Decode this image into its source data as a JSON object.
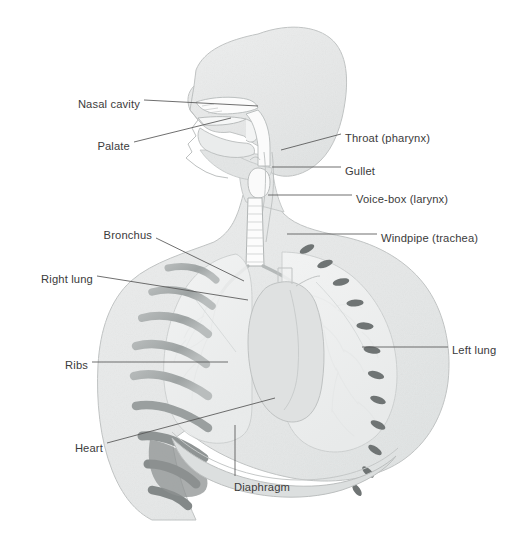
{
  "figure": {
    "background_color": "#ffffff",
    "label_color": "#3b3b3b",
    "leader_color": "#555555",
    "body_fill": "#e9eaea",
    "body_stroke": "#b9bcbc",
    "rib_fill": "#a9adad",
    "rib_dark_fill": "#8d9192",
    "lung_fill": "#f1f2f2",
    "airway_fill": "#fbfbfb",
    "heart_fill": "#dcdedd",
    "width": 515,
    "height": 540
  },
  "labels": [
    {
      "id": "nasal-cavity",
      "text": "Nasal cavity",
      "side": "left",
      "x": 140,
      "y": 104,
      "leader": "M144,100 L258,106"
    },
    {
      "id": "palate",
      "text": "Palate",
      "side": "left",
      "x": 130,
      "y": 146,
      "leader": "M134,142 L231,118"
    },
    {
      "id": "throat",
      "text": "Throat (pharynx)",
      "side": "right",
      "x": 345,
      "y": 138,
      "leader": "M341,134 L281,150"
    },
    {
      "id": "gullet",
      "text": "Gullet",
      "side": "right",
      "x": 345,
      "y": 171,
      "leader": "M341,167 L272,167"
    },
    {
      "id": "voice-box",
      "text": "Voice-box (larynx)",
      "side": "right",
      "x": 356,
      "y": 199,
      "leader": "M352,195 L268,195"
    },
    {
      "id": "windpipe",
      "text": "Windpipe (trachea)",
      "side": "right",
      "x": 381,
      "y": 238,
      "leader": "M377,234 L287,234"
    },
    {
      "id": "bronchus",
      "text": "Bronchus",
      "side": "left",
      "x": 152,
      "y": 235,
      "leader": "M156,238 L244,281"
    },
    {
      "id": "right-lung",
      "text": "Right lung",
      "side": "left",
      "x": 93,
      "y": 279,
      "leader": "M97,276 L248,300"
    },
    {
      "id": "ribs",
      "text": "Ribs",
      "side": "left",
      "x": 88,
      "y": 365,
      "leader": "M92,362 L228,362"
    },
    {
      "id": "heart",
      "text": "Heart",
      "side": "left",
      "x": 103,
      "y": 448,
      "leader": "M107,443 L275,398"
    },
    {
      "id": "left-lung",
      "text": "Left lung",
      "side": "right",
      "x": 452,
      "y": 350,
      "leader": "M448,347 L362,347"
    },
    {
      "id": "diaphragm",
      "text": "Diaphragm",
      "side": "center",
      "x": 262,
      "y": 487,
      "leader": "M235,476 L235,425"
    }
  ],
  "watermark_text": ""
}
